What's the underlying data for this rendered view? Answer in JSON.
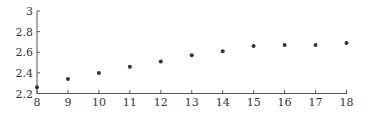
{
  "chart_data": {
    "type": "scatter",
    "title": "",
    "xlabel": "",
    "ylabel": "",
    "x": [
      8,
      9,
      10,
      11,
      12,
      13,
      14,
      15,
      16,
      17,
      18
    ],
    "series": [
      {
        "name": "",
        "values": [
          2.26,
          2.34,
          2.4,
          2.46,
          2.51,
          2.57,
          2.61,
          2.66,
          2.67,
          2.67,
          2.69
        ]
      }
    ],
    "xlim": [
      8,
      18
    ],
    "ylim": [
      2.2,
      3.0
    ],
    "xticks": [
      "8",
      "9",
      "10",
      "11",
      "12",
      "13",
      "14",
      "15",
      "16",
      "17",
      "18"
    ],
    "yticks": [
      "2.2",
      "2.4",
      "2.6",
      "2.8",
      "3"
    ],
    "grid": false,
    "legend": null,
    "marker_color": "#333333"
  }
}
